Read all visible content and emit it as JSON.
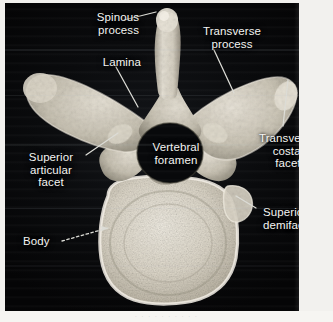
{
  "figure": {
    "view": "superior view",
    "ghost_caption": "· · · · · · · · · ·"
  },
  "colors": {
    "background": "#0a0b0d",
    "page": "#f2f1ee",
    "bone_light": "#e8e4da",
    "bone_mid": "#c9c3b4",
    "bone_shadow": "#6f6a5e",
    "label_text": "#f4f4f2",
    "leader_line": "#dcdcd6"
  },
  "labels": {
    "spinous_process": "Spinous\nprocess",
    "transverse_process": "Transverse\nprocess",
    "lamina": "Lamina",
    "vertebral_foramen": "Vertebral\nforamen",
    "superior_articular_facet": "Superior\narticular\nfacet",
    "transverse_costal_facet": "Transverse\ncostal\nfacet",
    "superior_demifacet": "Superior\ndemifacet",
    "body": "Body"
  }
}
